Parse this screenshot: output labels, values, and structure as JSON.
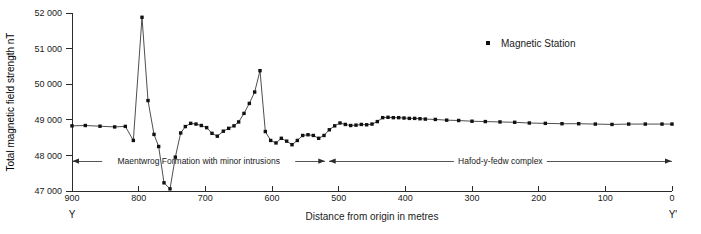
{
  "chart_data": {
    "type": "line",
    "title": "",
    "xlabel": "Distance from origin in metres",
    "ylabel": "Total magnetic field strength nT",
    "xlim": [
      900,
      0
    ],
    "ylim": [
      47000,
      52000
    ],
    "x_ticks": [
      900,
      800,
      700,
      600,
      500,
      400,
      300,
      200,
      100,
      0
    ],
    "x_tick_labels": [
      "900",
      "800",
      "700",
      "600",
      "500",
      "400",
      "300",
      "200",
      "100",
      "0"
    ],
    "y_ticks": [
      47000,
      48000,
      49000,
      50000,
      51000,
      52000
    ],
    "y_tick_labels": [
      "47 000",
      "48 000",
      "49 000",
      "50 000",
      "51 000",
      "52 000"
    ],
    "grid": false,
    "x_axis_direction": "descending",
    "legend": {
      "position": "top-right",
      "entries": [
        {
          "label": "Magnetic Station",
          "marker": "square",
          "color": "#111111"
        }
      ]
    },
    "endpoint_labels": {
      "left": "Y",
      "right": "Y'"
    },
    "series": [
      {
        "name": "Magnetic Station",
        "marker": "square",
        "color": "#111111",
        "x": [
          900,
          880,
          858,
          836,
          820,
          808,
          795,
          786,
          777,
          770,
          762,
          753,
          745,
          737,
          730,
          722,
          714,
          706,
          698,
          690,
          682,
          673,
          665,
          657,
          650,
          642,
          634,
          626,
          618,
          610,
          602,
          594,
          586,
          578,
          570,
          562,
          554,
          546,
          538,
          530,
          522,
          514,
          506,
          498,
          490,
          482,
          474,
          466,
          458,
          450,
          442,
          434,
          426,
          418,
          410,
          402,
          394,
          386,
          378,
          370,
          355,
          338,
          320,
          300,
          280,
          258,
          236,
          214,
          190,
          165,
          140,
          115,
          90,
          65,
          40,
          15,
          0
        ],
        "values": [
          48830,
          48840,
          48820,
          48800,
          48815,
          48420,
          51880,
          49540,
          48590,
          48250,
          47230,
          47060,
          47950,
          48630,
          48810,
          48900,
          48880,
          48840,
          48780,
          48620,
          48540,
          48680,
          48760,
          48830,
          48940,
          49180,
          49460,
          49780,
          50380,
          48670,
          48420,
          48350,
          48480,
          48400,
          48300,
          48420,
          48560,
          48580,
          48560,
          48480,
          48560,
          48720,
          48830,
          48910,
          48870,
          48840,
          48850,
          48870,
          48860,
          48880,
          48950,
          49060,
          49070,
          49060,
          49060,
          49050,
          49040,
          49040,
          49030,
          49020,
          49010,
          48990,
          48980,
          48960,
          48950,
          48940,
          48930,
          48910,
          48900,
          48890,
          48890,
          48880,
          48870,
          48880,
          48880,
          48880,
          48880
        ]
      }
    ],
    "annotations": [
      {
        "name": "maentwrog-band",
        "label": "Maentwrog Formation with  minor  intrusions",
        "y_value": 47840,
        "x_start": 900,
        "x_end": 520,
        "arrow_start": true,
        "arrow_end": true
      },
      {
        "name": "hafod-band",
        "label": "Hafod-y-fedw complex",
        "y_value": 47840,
        "x_start": 515,
        "x_end": 0,
        "arrow_start": true,
        "arrow_end": true
      }
    ]
  },
  "legend": {
    "entry_label": "Magnetic Station"
  },
  "axes": {
    "x_title": "Distance from origin in metres",
    "y_title": "Total magnetic field strength nT",
    "left_endpoint": "Y",
    "right_endpoint": "Y'"
  },
  "bands": {
    "left_label": "Maentwrog Formation with  minor  intrusions",
    "right_label": "Hafod-y-fedw complex"
  }
}
